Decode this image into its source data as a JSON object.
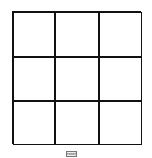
{
  "board": {
    "cells": [
      "",
      "",
      "",
      "",
      "",
      "",
      "",
      "",
      ""
    ]
  },
  "controls": {
    "button_label": "reset"
  }
}
